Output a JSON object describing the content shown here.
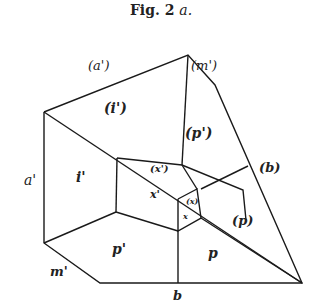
{
  "figure": {
    "title": "Fig. 2",
    "title_suffix": "a."
  },
  "labels": {
    "a_paren_prime": "(a')",
    "m_paren_prime": "(m')",
    "i_paren_prime": "(i')",
    "p_paren_prime": "(p')",
    "x_paren_prime": "(x')",
    "x_prime": "x'",
    "x_paren": "(x)",
    "x": "x",
    "b_paren": "(b)",
    "p_paren": "(p)",
    "a_prime": "a'",
    "i_prime": "i'",
    "p_prime": "p'",
    "p": "p",
    "m_prime": "m'",
    "b": "b"
  },
  "colors": {
    "line": "#1a1a1a",
    "text": "#222222",
    "background": "#ffffff"
  }
}
